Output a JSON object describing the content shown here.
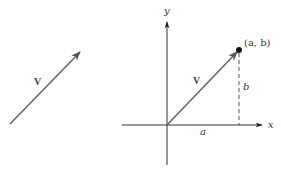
{
  "figure": {
    "left_panel": {
      "vector_label": "V",
      "vector": {
        "from": [
          10,
          124
        ],
        "to": [
          80,
          52
        ]
      }
    },
    "right_panel": {
      "x_axis_label": "x",
      "y_axis_label": "y",
      "vector_label": "V",
      "point_label": "(a, b)",
      "horizontal_component_label": "a",
      "vertical_component_label": "b",
      "origin": [
        167,
        125
      ],
      "point": [
        239,
        50
      ]
    },
    "colors": {
      "axis": "#333333",
      "vector": "#666666",
      "dashed": "#555555",
      "point": "#111111",
      "text": "#333333"
    }
  }
}
